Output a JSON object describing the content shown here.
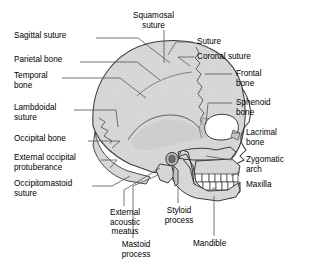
{
  "figure": {
    "background_color": "#ffffff",
    "bone_fill": "#d8d8d8",
    "bone_fill_dark": "#c4c4c4",
    "outline_color": "#3a3a3a",
    "leader_color": "#555555",
    "tooth_color": "#ffffff",
    "text_color": "#000000"
  },
  "labels": {
    "sagittal_suture": "Sagittal suture",
    "parietal_bone": "Parietal bone",
    "temporal_bone": "Temporal\nbone",
    "lambdoidal_suture": "Lambdoidal\nsuture",
    "occipital_bone": "Occipital bone",
    "external_occipital_protuberance": "External occipital\nprotuberance",
    "occipitomastoid_suture": "Occipitomastoid\nsuture",
    "squamosal_suture": "Squamosal\nsuture",
    "suture": "Suture",
    "coronal_suture": "Coronal suture",
    "frontal_bone": "Frontal\nbone",
    "sphenoid_bone": "Sphenoid\nbone",
    "lacrimal_bone": "Lacrimal\nbone",
    "zygomatic_arch": "Zygomatic\narch",
    "maxilla": "Maxilla",
    "mandible": "Mandible",
    "external_acoustic_meatus": "External\nacoustic\nmeatus",
    "mastoid_process": "Mastoid\nprocess",
    "styloid_process": "Styloid\nprocess"
  }
}
